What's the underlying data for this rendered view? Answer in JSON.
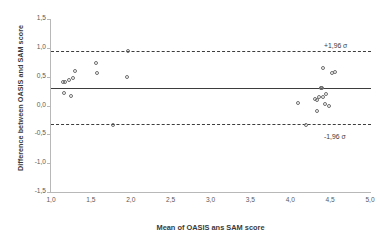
{
  "chart_data": {
    "type": "scatter",
    "title": "",
    "subtitle": "",
    "xlabel": "Mean of OASIS ans SAM score",
    "ylabel": "Difference between OASIS and SAM score",
    "xlim": [
      1.0,
      5.0
    ],
    "ylim": [
      -1.5,
      1.5
    ],
    "grid": false,
    "legend": null,
    "xticks": [
      "1,0",
      "1,5",
      "2,0",
      "2,5",
      "3,0",
      "3,5",
      "4,0",
      "4,5",
      "5,0"
    ],
    "xtick_values": [
      1.0,
      1.5,
      2.0,
      2.5,
      3.0,
      3.5,
      4.0,
      4.5,
      5.0
    ],
    "yticks": [
      "1,5",
      "1,0",
      "0,5",
      "0,0",
      "-0,5",
      "-1,0",
      "-1,5"
    ],
    "ytick_values": [
      1.5,
      1.0,
      0.5,
      0.0,
      -0.5,
      -1.0,
      -1.5
    ],
    "reflines": [
      {
        "name": "upper-loa",
        "value": 0.94,
        "style": "dashed",
        "label": "+1,96 σ"
      },
      {
        "name": "mean-bias",
        "value": 0.31,
        "style": "solid",
        "label": ""
      },
      {
        "name": "lower-loa",
        "value": -0.32,
        "style": "dashed",
        "label": "-1,96 σ"
      }
    ],
    "marker": {
      "shape": "circle",
      "filled": false,
      "edge_color": "#6e6e6e",
      "size": 4
    },
    "points": [
      {
        "x": 1.15,
        "y": 0.41
      },
      {
        "x": 1.17,
        "y": 0.4
      },
      {
        "x": 1.16,
        "y": 0.21
      },
      {
        "x": 1.25,
        "y": 0.16
      },
      {
        "x": 1.22,
        "y": 0.45
      },
      {
        "x": 1.28,
        "y": 0.47
      },
      {
        "x": 1.3,
        "y": 0.59
      },
      {
        "x": 1.56,
        "y": 0.74
      },
      {
        "x": 1.58,
        "y": 0.56
      },
      {
        "x": 1.78,
        "y": -0.33
      },
      {
        "x": 1.95,
        "y": 0.5
      },
      {
        "x": 1.96,
        "y": 0.94
      },
      {
        "x": 4.1,
        "y": 0.05
      },
      {
        "x": 4.2,
        "y": -0.33
      },
      {
        "x": 4.31,
        "y": 0.11
      },
      {
        "x": 4.34,
        "y": 0.09
      },
      {
        "x": 4.33,
        "y": -0.09
      },
      {
        "x": 4.36,
        "y": 0.14
      },
      {
        "x": 4.38,
        "y": 0.31
      },
      {
        "x": 4.4,
        "y": 0.31
      },
      {
        "x": 4.39,
        "y": 0.3
      },
      {
        "x": 4.41,
        "y": 0.15
      },
      {
        "x": 4.41,
        "y": 0.65
      },
      {
        "x": 4.43,
        "y": 0.03
      },
      {
        "x": 4.45,
        "y": 0.2
      },
      {
        "x": 4.48,
        "y": 0.0
      },
      {
        "x": 4.52,
        "y": 0.56
      },
      {
        "x": 4.56,
        "y": 0.58
      }
    ]
  }
}
